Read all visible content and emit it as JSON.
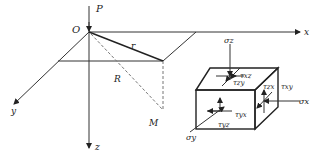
{
  "diagram": {
    "axes": {
      "x_label": "x",
      "y_label": "y",
      "z_label": "z"
    },
    "origin_label": "O",
    "load_label": "P",
    "radius_label": "r",
    "distance_label": "R",
    "point_label": "M",
    "stress_element": {
      "sigma_z": "σz",
      "sigma_x": "σx",
      "sigma_y": "σy",
      "tau_xz": "τxz",
      "tau_zy": "τzy",
      "tau_zx": "τzx",
      "tau_xy": "τxy",
      "tau_yx": "τyx",
      "tau_yz": "τyz"
    },
    "colors": {
      "line": "#333333",
      "dashed": "#777777",
      "background": "#ffffff"
    }
  }
}
